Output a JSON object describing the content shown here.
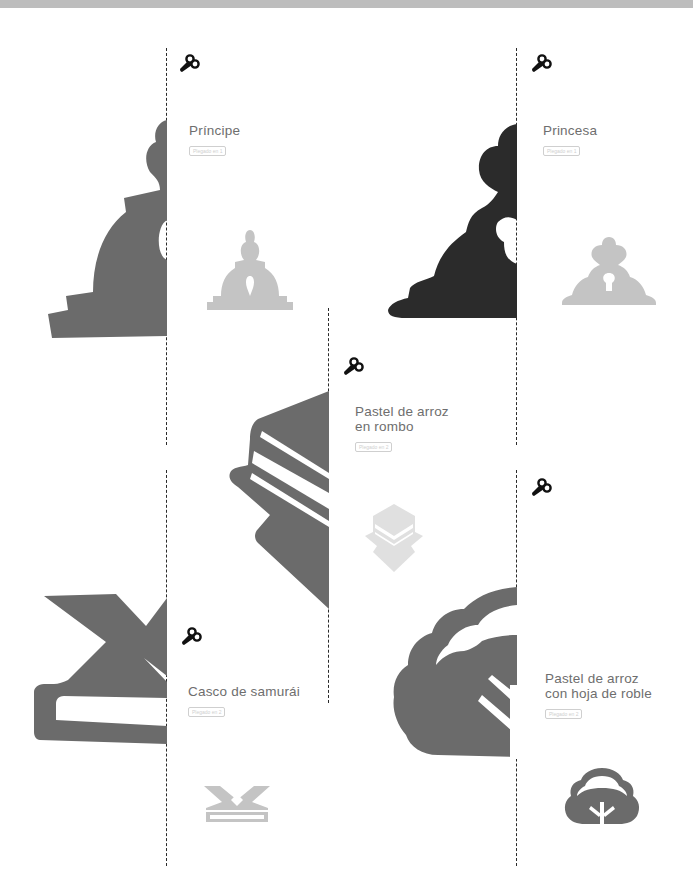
{
  "page": {
    "colors": {
      "top_band": "#bdbdbd",
      "silhouette_gray": "#6b6b6b",
      "silhouette_dark": "#2b2b2b",
      "preview_gray": "#c4c4c4",
      "title_text": "#6e6e6e",
      "dash_line": "#2a2a2a"
    }
  },
  "cards": [
    {
      "id": "principe",
      "title": "Príncipe",
      "badge": "Plegado en 1",
      "icon": "scissors-icon"
    },
    {
      "id": "princesa",
      "title": "Princesa",
      "badge": "Plegado en 1",
      "icon": "scissors-icon"
    },
    {
      "id": "pastel-rombo",
      "title_line1": "Pastel de arroz",
      "title_line2": "en rombo",
      "badge": "Plegado en 2",
      "icon": "scissors-icon"
    },
    {
      "id": "casco",
      "title": "Casco de samurái",
      "badge": "Plegado en 2",
      "icon": "scissors-icon"
    },
    {
      "id": "pastel-roble",
      "title_line1": "Pastel de arroz",
      "title_line2": "con hoja de roble",
      "badge": "Plegado en 2",
      "icon": "scissors-icon"
    }
  ]
}
